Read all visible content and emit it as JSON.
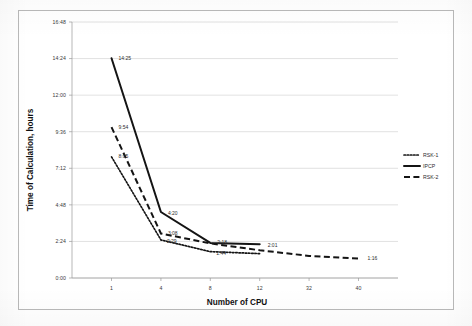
{
  "chart_data": {
    "type": "line",
    "title": "",
    "xlabel": "Number of CPU",
    "ylabel": "Time of Calculation, hours",
    "x_tick_labels": [
      "1",
      "4",
      "8",
      "12",
      "32",
      "40"
    ],
    "x_tick_values": [
      1,
      4,
      8,
      12,
      32,
      40
    ],
    "y_tick_labels": [
      "0:00",
      "2:24",
      "4:48",
      "7:12",
      "9:36",
      "12:00",
      "14:24",
      "16:48"
    ],
    "y_tick_values": [
      0,
      2.4,
      4.8,
      7.2,
      9.6,
      12.0,
      14.4,
      16.8
    ],
    "ylim": [
      0,
      16.8
    ],
    "xlim": [
      0,
      44
    ],
    "grid": "horizontal",
    "legend_position": "right",
    "series": [
      {
        "name": "RSK-1",
        "style": "dotted",
        "x": [
          1,
          4,
          8,
          12
        ],
        "values": [
          7.95,
          2.5,
          1.73,
          1.6
        ],
        "labels": [
          "8:05",
          "2:29",
          "1:44",
          ""
        ]
      },
      {
        "name": "IPCP",
        "style": "solid",
        "x": [
          1,
          4,
          8,
          12
        ],
        "values": [
          14.42,
          4.33,
          2.3,
          2.22
        ],
        "labels": [
          "14:25",
          "4:20",
          "2:18",
          "2:01"
        ]
      },
      {
        "name": "RSK-2",
        "style": "dashed",
        "x": [
          1,
          4,
          8,
          12,
          32,
          40
        ],
        "values": [
          9.9,
          2.92,
          2.27,
          1.82,
          1.45,
          1.27
        ],
        "labels": [
          "9:54",
          "3:08",
          "",
          "",
          "",
          "1:16"
        ]
      }
    ],
    "point_labels": [
      {
        "text": "14:25",
        "x": 1,
        "y": 14.42,
        "dx": 7,
        "dy": 1.5
      },
      {
        "text": "9:54",
        "x": 1,
        "y": 9.9,
        "dx": 7,
        "dy": 1.5
      },
      {
        "text": "8:05",
        "x": 1,
        "y": 7.95,
        "dx": 7,
        "dy": 1.5
      },
      {
        "text": "4:20",
        "x": 4,
        "y": 4.33,
        "dx": 7,
        "dy": 2.5
      },
      {
        "text": "3:08",
        "x": 4,
        "y": 2.92,
        "dx": 7,
        "dy": 1.5
      },
      {
        "text": "2:29",
        "x": 4,
        "y": 2.5,
        "dx": 6,
        "dy": 3.5
      },
      {
        "text": "2:18",
        "x": 8,
        "y": 2.3,
        "dx": 7,
        "dy": 1.0
      },
      {
        "text": "1:44",
        "x": 8,
        "y": 1.73,
        "dx": 6,
        "dy": 3.5
      },
      {
        "text": "2:01",
        "x": 12,
        "y": 2.05,
        "dx": 8,
        "dy": 0.0
      },
      {
        "text": "1:16",
        "x": 40,
        "y": 1.27,
        "dx": 9,
        "dy": 1.5
      }
    ],
    "legend": [
      {
        "label": "RSK-1",
        "style": "dotted"
      },
      {
        "label": "IPCP",
        "style": "solid"
      },
      {
        "label": "RSK-2",
        "style": "dashed"
      }
    ],
    "colors": {
      "series": "#141414",
      "grid": "#c8c8c8",
      "axis": "#9a9a9a",
      "text": "#2c2c2c",
      "background": "#ffffff"
    }
  }
}
